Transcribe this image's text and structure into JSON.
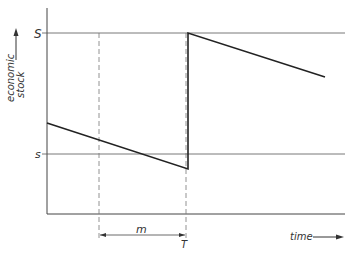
{
  "diagram": {
    "title": "",
    "y_axis_label_line1": "economic",
    "y_axis_label_line2": "stock",
    "x_axis_label": "time",
    "upper_level_label": "S",
    "lower_level_label": "s",
    "interval_label": "m",
    "reorder_time_label": "T",
    "colors": {
      "line": "#222222",
      "grid": "#555555",
      "dashed": "#777777"
    }
  }
}
